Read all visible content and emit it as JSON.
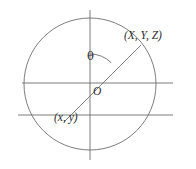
{
  "figure": {
    "kind": "geometry-diagram",
    "background_color": "#ffffff",
    "stroke_color": "#6e6e6e",
    "text_color": "#2b2b2b",
    "labels": {
      "point_upper_right": "(X, Y, Z)",
      "point_lower_left": "(x, y)",
      "origin": "O",
      "angle": "θ"
    },
    "geometry": {
      "circle": {
        "cx": 90,
        "cy": 84,
        "r": 66
      },
      "vertical_axis": {
        "x": 90,
        "y1": 10,
        "y2": 160
      },
      "horizontal_axis_main": {
        "y": 83,
        "x1": 22,
        "x2": 173
      },
      "horizontal_axis_lower": {
        "y": 115,
        "x1": 18,
        "x2": 173
      },
      "radial_line": {
        "x1": 65,
        "y1": 121,
        "x2": 140,
        "y2": 46
      },
      "angle_arc": {
        "cx": 90,
        "cy": 84,
        "r": 30,
        "from_deg": 90,
        "to_deg": 45
      }
    }
  }
}
